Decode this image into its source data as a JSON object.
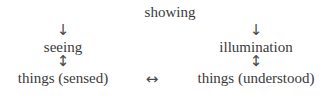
{
  "diagram": {
    "top": "showing",
    "left": {
      "arrow_down": "↓",
      "middle": "seeing",
      "arrow_updown": "↕",
      "bottom": "things (sensed)"
    },
    "right": {
      "arrow_down": "↓",
      "middle": "illumination",
      "arrow_updown": "↕",
      "bottom": "things (understood)"
    },
    "bottom_link": "↔"
  }
}
